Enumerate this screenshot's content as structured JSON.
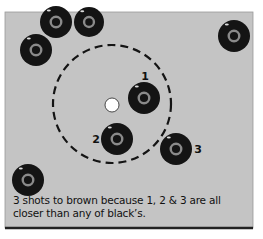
{
  "caption": "3 shots to brown because 1, 2 & 3 are all closer than any of black’s.",
  "colors": {
    "green": "#c4c4c4",
    "bowl": "#141414",
    "ring": "#8a8a8a",
    "jack": "#ffffff",
    "border": "#222222"
  },
  "jack": {
    "x": 112,
    "y": 105,
    "r": 7
  },
  "measure_circle": {
    "cx": 112,
    "cy": 104,
    "r": 59
  },
  "bowls": [
    {
      "id": "black-1",
      "x": 56,
      "y": 22,
      "r": 16,
      "label": ""
    },
    {
      "id": "black-2",
      "x": 89,
      "y": 22,
      "r": 15,
      "label": ""
    },
    {
      "id": "black-3",
      "x": 36,
      "y": 50,
      "r": 16,
      "label": ""
    },
    {
      "id": "black-4",
      "x": 234,
      "y": 36,
      "r": 16,
      "label": ""
    },
    {
      "id": "black-5",
      "x": 28,
      "y": 180,
      "r": 16,
      "label": ""
    },
    {
      "id": "brown-1",
      "x": 144,
      "y": 98,
      "r": 16,
      "label": "1"
    },
    {
      "id": "brown-2",
      "x": 117,
      "y": 139,
      "r": 16,
      "label": "2"
    },
    {
      "id": "brown-3",
      "x": 176,
      "y": 149,
      "r": 16,
      "label": "3"
    }
  ],
  "labels": [
    {
      "text": "1",
      "x": 145,
      "y": 80
    },
    {
      "text": "2",
      "x": 96,
      "y": 143
    },
    {
      "text": "3",
      "x": 198,
      "y": 153
    }
  ]
}
